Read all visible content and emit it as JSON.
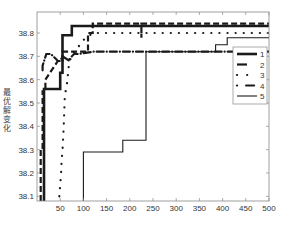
{
  "chart_data": {
    "type": "line",
    "title": "",
    "xlabel": "",
    "ylabel": "最优解变化",
    "xlim": [
      0,
      500
    ],
    "ylim": [
      38.08,
      38.89
    ],
    "xticks": [
      50,
      100,
      150,
      200,
      250,
      300,
      350,
      400,
      450,
      500
    ],
    "yticks": [
      38.1,
      38.2,
      38.3,
      38.4,
      38.5,
      38.6,
      38.7,
      38.8
    ],
    "grid": false,
    "legend_position": "right",
    "series": [
      {
        "name": "1",
        "style": "thick-solid",
        "x": [
          15,
          15,
          50,
          50,
          55,
          55,
          75,
          75,
          500
        ],
        "y": [
          38.08,
          38.56,
          38.56,
          38.63,
          38.63,
          38.79,
          38.79,
          38.83,
          38.83
        ]
      },
      {
        "name": "2",
        "style": "dashed",
        "x": [
          8,
          8,
          12,
          12,
          18,
          18,
          45,
          55,
          55,
          110,
          110,
          120,
          120,
          225,
          225,
          225,
          500
        ],
        "y": [
          38.08,
          38.3,
          38.3,
          38.55,
          38.55,
          38.6,
          38.68,
          38.68,
          38.72,
          38.72,
          38.8,
          38.8,
          38.84,
          38.84,
          38.78,
          38.84,
          38.84
        ]
      },
      {
        "name": "3",
        "style": "dotted",
        "x": [
          48,
          50,
          52,
          53,
          55,
          57,
          58,
          60,
          65,
          70,
          100,
          120,
          230,
          500
        ],
        "y": [
          38.1,
          38.15,
          38.2,
          38.25,
          38.3,
          38.37,
          38.42,
          38.53,
          38.59,
          38.69,
          38.77,
          38.8,
          38.8,
          38.8
        ]
      },
      {
        "name": "4",
        "style": "dash-dot",
        "x": [
          12,
          12,
          20,
          30,
          45,
          50,
          55,
          70,
          75,
          80,
          90,
          120,
          500
        ],
        "y": [
          38.64,
          38.66,
          38.71,
          38.71,
          38.68,
          38.68,
          38.7,
          38.68,
          38.7,
          38.71,
          38.71,
          38.72,
          38.72
        ]
      },
      {
        "name": "5",
        "style": "thin-solid",
        "x": [
          100,
          100,
          185,
          185,
          235,
          235,
          385,
          385,
          410,
          410,
          500
        ],
        "y": [
          38.08,
          38.29,
          38.29,
          38.34,
          38.34,
          38.72,
          38.72,
          38.75,
          38.75,
          38.78,
          38.78
        ]
      }
    ]
  }
}
